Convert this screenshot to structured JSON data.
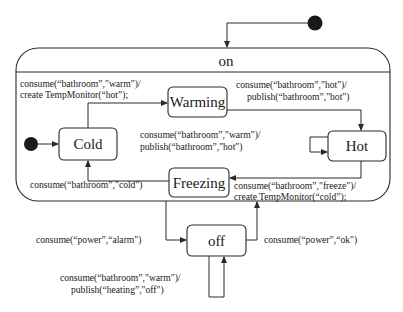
{
  "diagram": {
    "type": "state-machine",
    "composite_state": {
      "name": "on"
    },
    "states": {
      "cold": {
        "name": "Cold"
      },
      "warming": {
        "name": "Warming"
      },
      "hot": {
        "name": "Hot"
      },
      "freezing": {
        "name": "Freezing"
      },
      "off": {
        "name": "off"
      }
    },
    "transitions": {
      "cold_to_warming": {
        "from": "Cold",
        "to": "Warming",
        "line1": "consume(“bathroom”,\"warm\")/",
        "line2": "create TempMonitor(“hot”);"
      },
      "warming_to_hot": {
        "from": "Warming",
        "to": "Hot",
        "line1": "consume(“bathroom”,\"hot\")/",
        "line2": "publish(“bathroom”,\"hot\")"
      },
      "hot_self": {
        "from": "Hot",
        "to": "Hot",
        "line1": "consume(“bathroom”,\"warm\")/",
        "line2": "publish(“bathroom”,\"hot\")"
      },
      "hot_to_freezing": {
        "from": "Hot",
        "to": "Freezing",
        "line1": "consume(“bathroom”,\"freeze\")/",
        "line2": "create TempMonitor(“cold”);"
      },
      "freezing_to_cold": {
        "from": "Freezing",
        "to": "Cold",
        "line1": "consume(“bathroom”,\"cold\")"
      },
      "on_to_off": {
        "from": "on",
        "to": "off",
        "line1": "consume(“power”,“alarm\")"
      },
      "off_to_on": {
        "from": "off",
        "to": "on",
        "line1": "consume(“power”,“ok\")"
      },
      "off_self": {
        "from": "off",
        "to": "off",
        "line1": "consume(“bathroom”,\"warm\")/",
        "line2": "publish(“heating”,\"off\")"
      }
    },
    "initial_nodes": [
      "top-level initial",
      "on initial"
    ],
    "colors": {
      "stroke": "#2a2a2a",
      "text": "#1a1a1a",
      "background": "#ffffff"
    }
  }
}
